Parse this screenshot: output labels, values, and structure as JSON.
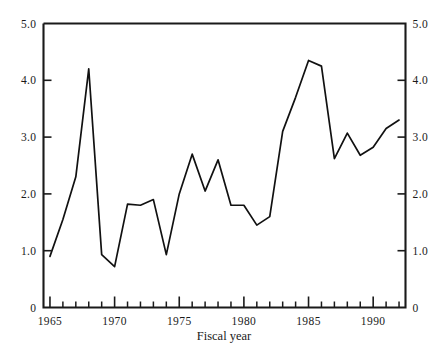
{
  "chart_data": {
    "type": "line",
    "title": "",
    "subtitle": "",
    "xlabel": "Fiscal year",
    "ylabel": "",
    "xlim": [
      1964.5,
      1992.5
    ],
    "ylim": [
      0,
      5.0
    ],
    "grid": false,
    "legend": null,
    "x_tick_labels": [
      "1965",
      "1970",
      "1975",
      "1980",
      "1985",
      "1990"
    ],
    "x_tick_values": [
      1965,
      1970,
      1975,
      1980,
      1985,
      1990
    ],
    "x_minor_tick_step": 1,
    "y_tick_labels_left": [
      "0",
      "1.0",
      "2.0",
      "3.0",
      "4.0",
      "5.0"
    ],
    "y_tick_labels_right": [
      "0",
      "1.0",
      "2.0",
      "3.0",
      "4.0",
      "5.0"
    ],
    "y_tick_values": [
      0,
      1.0,
      2.0,
      3.0,
      4.0,
      5.0
    ],
    "axes_both_sides": true,
    "series": [
      {
        "name": "",
        "color": "#111111",
        "x": [
          1965,
          1966,
          1967,
          1968,
          1969,
          1970,
          1971,
          1972,
          1973,
          1974,
          1975,
          1976,
          1977,
          1978,
          1979,
          1980,
          1981,
          1982,
          1983,
          1984,
          1985,
          1986,
          1987,
          1988,
          1989,
          1990,
          1991,
          1992
        ],
        "values": [
          0.9,
          1.55,
          2.3,
          4.2,
          0.93,
          0.72,
          1.82,
          1.8,
          1.9,
          0.93,
          2.0,
          2.7,
          2.05,
          2.6,
          1.8,
          1.8,
          1.45,
          1.6,
          3.1,
          3.7,
          4.35,
          4.25,
          2.62,
          3.07,
          2.68,
          2.82,
          3.15,
          3.3
        ]
      }
    ]
  },
  "labels": {
    "x_axis_title": "Fiscal year"
  }
}
